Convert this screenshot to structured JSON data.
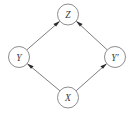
{
  "diagram": {
    "type": "directed-acyclic-graph",
    "layout": "diamond",
    "background_color": "#ffffff",
    "node_stroke_color": "#808084",
    "edge_color": "#6e6e72",
    "arrowhead_color": "#2a2a2e",
    "label_color": "#3a3a3e",
    "nodes": [
      {
        "id": "Z",
        "label": "Z",
        "name": "node-z",
        "cx": 68,
        "cy": 14.5,
        "r": 10.5,
        "position": "top"
      },
      {
        "id": "Y",
        "label": "Y",
        "name": "node-y",
        "cx": 19,
        "cy": 57,
        "r": 10.5,
        "position": "left"
      },
      {
        "id": "Yprime",
        "label": "Y′",
        "name": "node-y-prime",
        "cx": 115,
        "cy": 57,
        "r": 10.5,
        "position": "right"
      },
      {
        "id": "X",
        "label": "X",
        "name": "node-x",
        "cx": 68,
        "cy": 97.5,
        "r": 10.5,
        "position": "bottom"
      }
    ],
    "edges": [
      {
        "id": "x-to-y",
        "from": "X",
        "to": "Y",
        "name": "edge-x-to-y",
        "directed": true,
        "arrow_at": "Y"
      },
      {
        "id": "x-to-yprime",
        "from": "X",
        "to": "Yprime",
        "name": "edge-x-to-y-prime",
        "directed": true,
        "arrow_at": "Yprime"
      },
      {
        "id": "y-to-z",
        "from": "Y",
        "to": "Z",
        "name": "edge-y-to-z",
        "directed": true,
        "arrow_at": "Z"
      },
      {
        "id": "yprime-to-z",
        "from": "Yprime",
        "to": "Z",
        "name": "edge-y-prime-to-z",
        "directed": true,
        "arrow_at": "Z"
      }
    ]
  }
}
